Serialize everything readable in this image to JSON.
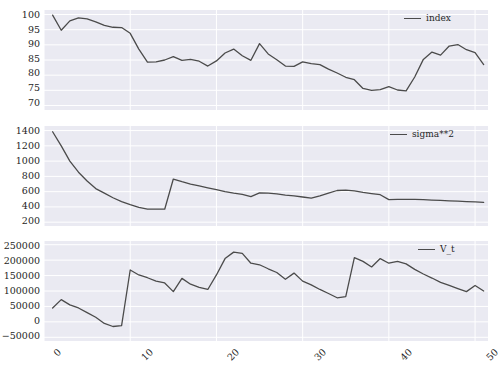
{
  "figure": {
    "background_color": "#ffffff",
    "axes_facecolor": "#eaeaf2",
    "grid_color": "#ffffff",
    "line_color": "#4b4b4b",
    "tick_color": "#262626"
  },
  "chart_data": [
    {
      "type": "line",
      "title": "",
      "xlabel": "",
      "ylabel": "",
      "legend_position": "upper right",
      "grid": true,
      "xlim": [
        0,
        51.5
      ],
      "ylim": [
        68.5,
        101.5
      ],
      "xticks": [
        0,
        10,
        20,
        30,
        40,
        50
      ],
      "yticks": [
        70,
        75,
        80,
        85,
        90,
        95,
        100
      ],
      "series": [
        {
          "name": "index",
          "color": "#4b4b4b",
          "x": [
            1,
            2,
            3,
            4,
            5,
            6,
            7,
            8,
            9,
            10,
            11,
            12,
            13,
            14,
            15,
            16,
            17,
            18,
            19,
            20,
            21,
            22,
            23,
            24,
            25,
            26,
            27,
            28,
            29,
            30,
            31,
            32,
            33,
            34,
            35,
            36,
            37,
            38,
            39,
            40,
            41,
            42,
            43,
            44,
            45,
            46,
            47,
            48,
            49,
            50,
            51
          ],
          "values": [
            99.8,
            94.8,
            97.9,
            98.9,
            98.6,
            97.6,
            96.4,
            95.8,
            95.7,
            93.8,
            88.6,
            84.3,
            84.4,
            85.0,
            86.1,
            84.9,
            85.2,
            84.6,
            83.0,
            84.7,
            87.3,
            88.6,
            86.4,
            84.9,
            90.4,
            87.0,
            85.1,
            83.0,
            82.9,
            84.4,
            83.8,
            83.5,
            82.0,
            80.7,
            79.3,
            78.5,
            75.6,
            75.0,
            75.2,
            76.2,
            75.1,
            74.8,
            79.4,
            85.2,
            87.6,
            86.6,
            89.6,
            90.1,
            88.4,
            87.4,
            83.5
          ]
        }
      ]
    },
    {
      "type": "line",
      "title": "",
      "xlabel": "",
      "ylabel": "",
      "legend_position": "upper right",
      "grid": true,
      "xlim": [
        0,
        51.5
      ],
      "ylim": [
        150,
        1460
      ],
      "xticks": [
        0,
        10,
        20,
        30,
        40,
        50
      ],
      "yticks": [
        200,
        400,
        600,
        800,
        1000,
        1200,
        1400
      ],
      "series": [
        {
          "name": "sigma**2",
          "color": "#4b4b4b",
          "x": [
            1,
            2,
            3,
            4,
            5,
            6,
            7,
            8,
            9,
            10,
            11,
            12,
            13,
            14,
            15,
            16,
            17,
            18,
            19,
            20,
            21,
            22,
            23,
            24,
            25,
            26,
            27,
            28,
            29,
            30,
            31,
            32,
            33,
            34,
            35,
            36,
            37,
            38,
            39,
            40,
            41,
            42,
            43,
            44,
            45,
            46,
            47,
            48,
            49,
            50,
            51
          ],
          "values": [
            1385,
            1200,
            1000,
            855,
            740,
            640,
            580,
            520,
            470,
            430,
            395,
            372,
            370,
            370,
            765,
            730,
            700,
            675,
            650,
            625,
            600,
            580,
            565,
            535,
            585,
            580,
            570,
            555,
            545,
            530,
            515,
            545,
            580,
            615,
            620,
            610,
            590,
            575,
            560,
            495,
            500,
            500,
            500,
            495,
            490,
            485,
            480,
            475,
            470,
            465,
            460
          ]
        }
      ]
    },
    {
      "type": "line",
      "title": "",
      "xlabel": "",
      "ylabel": "",
      "legend_position": "upper right",
      "grid": true,
      "xlim": [
        0,
        51.5
      ],
      "ylim": [
        -62000,
        262000
      ],
      "xticks": [
        0,
        10,
        20,
        30,
        40,
        50
      ],
      "yticks": [
        -50000,
        0,
        50000,
        100000,
        150000,
        200000,
        250000
      ],
      "series": [
        {
          "name": "V_t",
          "color": "#4b4b4b",
          "x": [
            1,
            2,
            3,
            4,
            5,
            6,
            7,
            8,
            9,
            10,
            11,
            12,
            13,
            14,
            15,
            16,
            17,
            18,
            19,
            20,
            21,
            22,
            23,
            24,
            25,
            26,
            27,
            28,
            29,
            30,
            31,
            32,
            33,
            34,
            35,
            36,
            37,
            38,
            39,
            40,
            41,
            42,
            43,
            44,
            45,
            46,
            47,
            48,
            49,
            50,
            51
          ],
          "values": [
            45000,
            72000,
            55000,
            45000,
            30000,
            15000,
            -5000,
            -15000,
            -12000,
            168000,
            152000,
            143000,
            132000,
            126000,
            98000,
            141000,
            122000,
            112000,
            105000,
            152000,
            205000,
            226000,
            222000,
            190000,
            185000,
            172000,
            160000,
            138000,
            158000,
            132000,
            120000,
            105000,
            92000,
            78000,
            82000,
            208000,
            196000,
            178000,
            205000,
            190000,
            196000,
            188000,
            170000,
            155000,
            142000,
            128000,
            118000,
            108000,
            98000,
            118000,
            100000
          ]
        }
      ]
    }
  ],
  "panels": [
    {
      "id": "panel-index",
      "legend_label": "index",
      "ytick_labels": [
        "100",
        "95",
        "90",
        "85",
        "80",
        "75",
        "70"
      ]
    },
    {
      "id": "panel-sigma",
      "legend_label": "sigma**2",
      "ytick_labels": [
        "1400",
        "1200",
        "1000",
        "800",
        "600",
        "400",
        "200"
      ]
    },
    {
      "id": "panel-vt",
      "legend_label": "V_t",
      "ytick_labels": [
        "250000",
        "200000",
        "150000",
        "100000",
        "50000",
        "0",
        "−50000"
      ]
    }
  ],
  "xaxis": {
    "tick_labels": [
      "0",
      "10",
      "20",
      "30",
      "40",
      "50"
    ]
  }
}
